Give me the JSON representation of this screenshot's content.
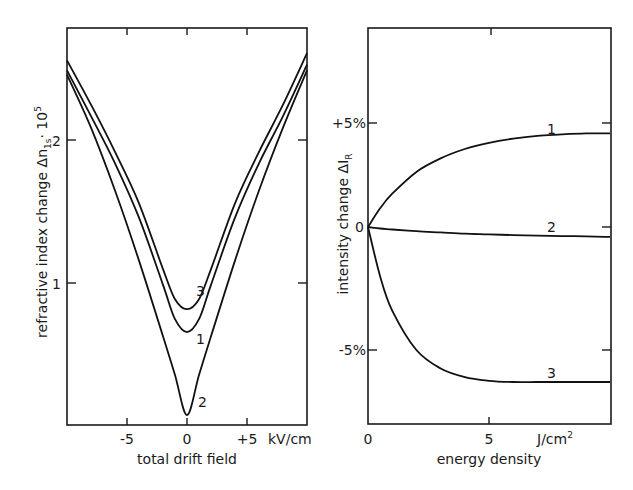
{
  "chart_data": [
    {
      "type": "line",
      "title": "",
      "xlabel": "total drift field",
      "x_unit": "kV/cm",
      "ylabel": "refractive index change Δn_{1s} · 10^5",
      "xlim": [
        -10,
        10
      ],
      "ylim": [
        0,
        2.78
      ],
      "x_ticks": [
        -5,
        0,
        5
      ],
      "x_tick_labels": [
        "-5",
        "0",
        "+5"
      ],
      "y_ticks": [
        1,
        2
      ],
      "y_tick_labels": [
        "1",
        "2"
      ],
      "grid": false,
      "legend": "curve labels inline (1, 2, 3)",
      "x": [
        -10,
        -8,
        -6,
        -4,
        -2,
        -1,
        0,
        1,
        2,
        4,
        6,
        8,
        10
      ],
      "series": [
        {
          "name": "1",
          "values": [
            2.48,
            2.16,
            1.83,
            1.45,
            0.98,
            0.74,
            0.65,
            0.74,
            0.98,
            1.45,
            1.83,
            2.16,
            2.52
          ]
        },
        {
          "name": "2",
          "values": [
            2.45,
            2.08,
            1.64,
            1.15,
            0.62,
            0.35,
            0.07,
            0.35,
            0.62,
            1.15,
            1.64,
            2.08,
            2.48
          ]
        },
        {
          "name": "3",
          "values": [
            2.55,
            2.24,
            1.91,
            1.55,
            1.09,
            0.88,
            0.81,
            0.88,
            1.09,
            1.55,
            1.91,
            2.24,
            2.6
          ]
        }
      ]
    },
    {
      "type": "line",
      "title": "",
      "xlabel": "energy density",
      "x_unit": "J/cm²",
      "ylabel": "intensity change ΔI_R",
      "xlim": [
        0,
        10
      ],
      "ylim": [
        -8.5,
        8.3
      ],
      "x_ticks": [
        0,
        5
      ],
      "x_tick_labels": [
        "0",
        "5"
      ],
      "y_ticks": [
        5,
        0,
        -5
      ],
      "y_tick_labels": [
        "+5%",
        "0",
        "-5%"
      ],
      "grid": false,
      "legend": "curve labels inline (1, 2, 3)",
      "x": [
        0,
        0.5,
        1,
        2,
        3,
        4,
        5,
        6,
        7,
        8,
        9,
        10
      ],
      "series": [
        {
          "name": "1",
          "values": [
            0,
            0.9,
            1.6,
            2.65,
            3.3,
            3.75,
            4.05,
            4.25,
            4.38,
            4.45,
            4.5,
            4.5
          ]
        },
        {
          "name": "2",
          "values": [
            0,
            -0.06,
            -0.1,
            -0.17,
            -0.22,
            -0.27,
            -0.3,
            -0.33,
            -0.35,
            -0.37,
            -0.38,
            -0.4
          ]
        },
        {
          "name": "3",
          "values": [
            0,
            -2.0,
            -3.4,
            -5.0,
            -5.75,
            -6.1,
            -6.25,
            -6.3,
            -6.3,
            -6.3,
            -6.3,
            -6.3
          ]
        }
      ]
    }
  ],
  "left_panel": {
    "ylabel": "refractive index change Δn",
    "ylabel_sub": "1s",
    "ylabel_suffix": "· 10",
    "ylabel_exp": "5",
    "xlabel": "total drift field",
    "x_unit": "kV/cm",
    "x_tick_labels": [
      "-5",
      "0",
      "+5"
    ],
    "y_tick_labels": [
      "1",
      "2"
    ],
    "curve_labels": [
      "1",
      "2",
      "3"
    ]
  },
  "right_panel": {
    "ylabel": "intensity change ΔI",
    "ylabel_sub": "R",
    "xlabel": "energy density",
    "x_unit": "J/cm",
    "x_unit_exp": "2",
    "x_tick_labels": [
      "0",
      "5"
    ],
    "y_tick_labels": [
      "+5%",
      "0",
      "-5%"
    ],
    "curve_labels": [
      "1",
      "2",
      "3"
    ]
  }
}
